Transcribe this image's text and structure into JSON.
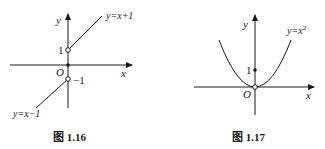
{
  "figures": [
    {
      "caption": "图 1.16",
      "axis_x_label": "x",
      "axis_y_label": "y",
      "origin_label": "O",
      "tick_pos_label": "1",
      "tick_neg_label": "−1",
      "curve_upper_label": "y=x+1",
      "curve_lower_label": "y=x−1",
      "points": [
        {
          "desc": "(0,1)",
          "style": "open"
        },
        {
          "desc": "(0,0)",
          "style": "filled"
        },
        {
          "desc": "(0,-1)",
          "style": "open"
        }
      ]
    },
    {
      "caption": "图 1.17",
      "axis_x_label": "x",
      "axis_y_label": "y",
      "origin_label": "O",
      "tick_pos_label": "1",
      "curve_label_base": "y=x",
      "curve_label_exp": "2",
      "points": [
        {
          "desc": "(0,1)",
          "style": "filled"
        },
        {
          "desc": "(0,0)",
          "style": "open"
        }
      ]
    }
  ],
  "colors": {
    "ink": "#1a1a1a",
    "background": "#ffffff"
  }
}
